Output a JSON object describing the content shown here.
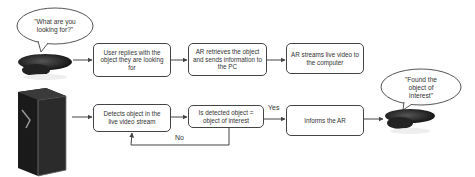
{
  "diagram": {
    "speech_bubbles": {
      "top_left": "\"What are you looking for?\"",
      "right": "\"Found the object of interest\""
    },
    "top_row": [
      {
        "id": "user-replies",
        "label": "User replies with the object they are looking for"
      },
      {
        "id": "ar-retrieves",
        "label": "AR retrieves the object and sends information to the PC"
      },
      {
        "id": "ar-streams",
        "label": "AR streams live video to the computer"
      }
    ],
    "bottom_row": [
      {
        "id": "detects-object",
        "label": "Detects object in the live video stream"
      },
      {
        "id": "decision",
        "label": "Is detected object = object of interest"
      },
      {
        "id": "informs-ar",
        "label": "Informs the AR"
      }
    ],
    "edge_labels": {
      "yes": "Yes",
      "no": "No"
    },
    "icons": [
      "ar-headset-icon",
      "pc-tower-icon",
      "ar-headset-icon"
    ]
  }
}
